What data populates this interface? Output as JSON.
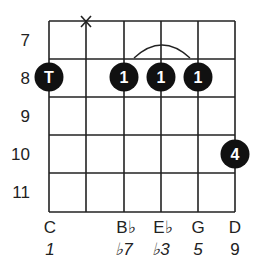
{
  "chord": {
    "root": "C",
    "strings": 6,
    "frets": [
      7,
      8,
      9,
      10,
      11
    ],
    "fret_labels": [
      "7",
      "8",
      "9",
      "10",
      "11"
    ],
    "muted_strings": [
      2
    ],
    "muted_symbol": "X",
    "barre": {
      "fret": 8,
      "from_string": 3,
      "to_string": 5
    },
    "fingering": [
      {
        "string": 1,
        "fret": 8,
        "finger": "T"
      },
      {
        "string": 3,
        "fret": 8,
        "finger": "1"
      },
      {
        "string": 4,
        "fret": 8,
        "finger": "1"
      },
      {
        "string": 5,
        "fret": 8,
        "finger": "1"
      },
      {
        "string": 6,
        "fret": 10,
        "finger": "4"
      }
    ],
    "notes": [
      "C",
      "",
      "B♭",
      "E♭",
      "G",
      "D"
    ],
    "intervals": [
      "1",
      "",
      "♭7",
      "♭3",
      "5",
      "9"
    ]
  }
}
